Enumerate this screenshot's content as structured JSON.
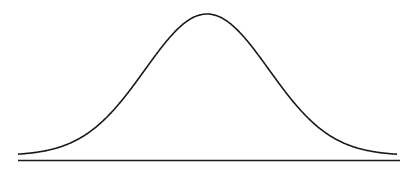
{
  "diagram": {
    "type": "normal-distribution-curve",
    "curve_color": "#1a1a1a",
    "baseline_color": "#1a1a1a",
    "background": "#ffffff"
  }
}
